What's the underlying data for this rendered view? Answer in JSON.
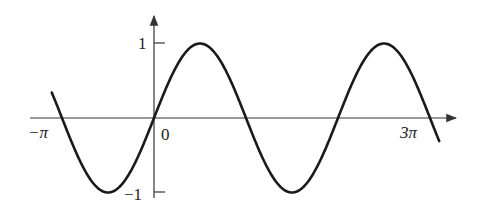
{
  "chart_data": {
    "type": "line",
    "title": "",
    "xlabel": "",
    "ylabel": "",
    "function": "y = sin(x)",
    "x_range": [
      -3.49,
      9.74
    ],
    "ylim": [
      -1,
      1
    ],
    "grid": false,
    "legend": null,
    "x_ticks": [
      {
        "value": -3.14159,
        "label": "−π"
      },
      {
        "value": 0,
        "label": "0"
      },
      {
        "value": 9.42478,
        "label": "3π"
      }
    ],
    "y_ticks": [
      {
        "value": 1,
        "label": "1"
      },
      {
        "value": -1,
        "label": "−1"
      }
    ],
    "series": [
      {
        "name": "sin x",
        "x": [
          -3.49,
          -3.14159,
          -2.356,
          -1.5708,
          -0.785,
          0,
          0.785,
          1.5708,
          2.356,
          3.14159,
          3.927,
          4.7124,
          5.498,
          6.28318,
          7.069,
          7.854,
          8.639,
          9.42478,
          9.74
        ],
        "values": [
          0.34,
          0,
          -0.707,
          -1,
          -0.707,
          0,
          0.707,
          1,
          0.707,
          0,
          -0.707,
          -1,
          -0.707,
          0,
          0.707,
          1,
          0.707,
          0,
          -0.31
        ]
      }
    ],
    "colors": {
      "curve": "#1a1a1a",
      "axes": "#333333"
    }
  },
  "labels": {
    "neg_pi": "−π",
    "zero": "0",
    "three_pi": "3π",
    "y_one": "1",
    "y_neg_one": "−1"
  }
}
